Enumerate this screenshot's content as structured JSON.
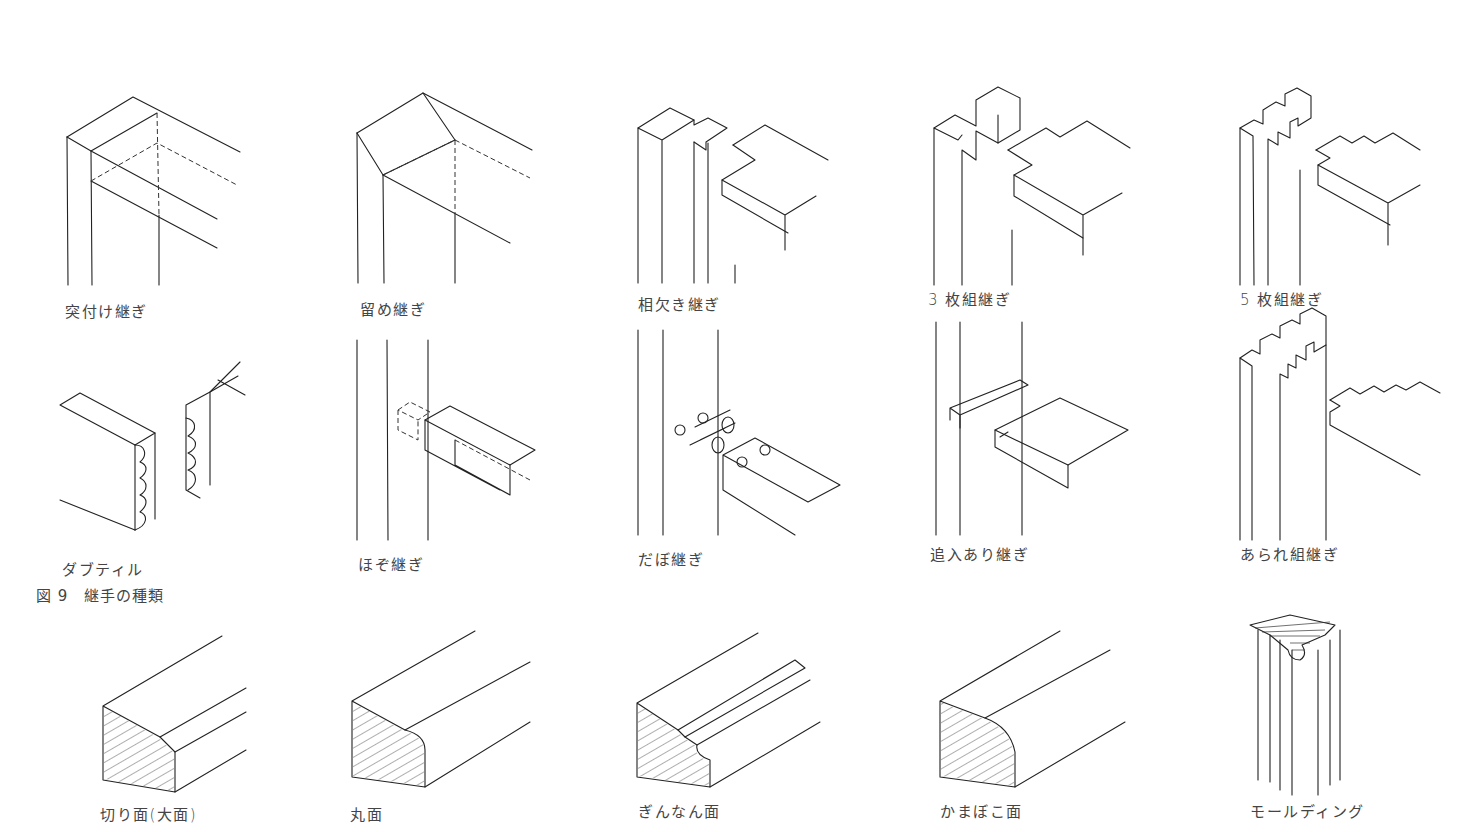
{
  "figure": {
    "caption": "図 9　継手の種類",
    "joints_row1": [
      {
        "label": "突付け継ぎ",
        "x": 65,
        "y": 300
      },
      {
        "label": "留め継ぎ",
        "x": 360,
        "y": 298
      },
      {
        "label": "相欠き継ぎ",
        "x": 638,
        "y": 293
      },
      {
        "label": "3 枚組継ぎ",
        "x": 928,
        "y": 288
      },
      {
        "label": "5 枚組継ぎ",
        "x": 1240,
        "y": 288
      }
    ],
    "joints_row2": [
      {
        "label": "ダブティル",
        "x": 62,
        "y": 558
      },
      {
        "label": "ほぞ継ぎ",
        "x": 358,
        "y": 553
      },
      {
        "label": "だぼ継ぎ",
        "x": 638,
        "y": 548
      },
      {
        "label": "追入あり継ぎ",
        "x": 930,
        "y": 543
      },
      {
        "label": "あられ組継ぎ",
        "x": 1240,
        "y": 543
      }
    ],
    "moldings": [
      {
        "label": "切り面(大面)",
        "x": 100,
        "y": 803
      },
      {
        "label": "丸面",
        "x": 350,
        "y": 803
      },
      {
        "label": "ぎんなん面",
        "x": 638,
        "y": 800
      },
      {
        "label": "かまぼこ面",
        "x": 940,
        "y": 800
      },
      {
        "label": "モールディング",
        "x": 1250,
        "y": 800
      }
    ]
  }
}
